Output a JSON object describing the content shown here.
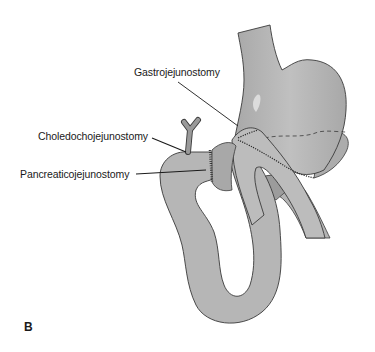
{
  "figure": {
    "panel_letter": "B",
    "colors": {
      "organ_fill": "#b8b8b8",
      "organ_shade": "#a4a4a4",
      "organ_highlight": "#d2d2d2",
      "outline": "#3a3a3a",
      "leader_line": "#1a1a1a",
      "background": "#ffffff"
    },
    "labels": [
      {
        "id": "gastrojejunostomy",
        "text": "Gastrojejunostomy"
      },
      {
        "id": "choledochojejunostomy",
        "text": "Choledochojejunostomy"
      },
      {
        "id": "pancreaticojejunostomy",
        "text": "Pancreaticojejunostomy"
      }
    ],
    "structures": [
      "esophagus",
      "stomach-remnant",
      "jejunal-limb",
      "common-bile-duct",
      "pancreatic-remnant",
      "efferent-limb"
    ]
  }
}
